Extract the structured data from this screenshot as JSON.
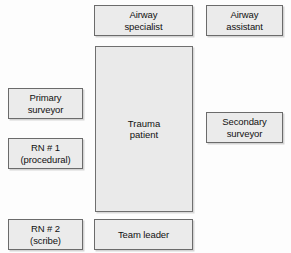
{
  "diagram": {
    "type": "room-layout-diagram",
    "canvas": {
      "width": 291,
      "height": 253,
      "background": "#fdfdfd"
    },
    "style": {
      "box_fill": "#ebebeb",
      "box_border": "#6b6b6b",
      "patient_fill": "#eaeaea",
      "patient_border": "#6f6f6f",
      "text_color": "#111111"
    },
    "patient": {
      "label": "Trauma\npatient",
      "x": 95,
      "y": 46,
      "width": 98,
      "height": 166
    },
    "roles": [
      {
        "name": "airway-specialist",
        "label": "Airway\nspecialist",
        "x": 94,
        "y": 5,
        "width": 99,
        "height": 31
      },
      {
        "name": "airway-assistant",
        "label": "Airway\nassistant",
        "x": 206,
        "y": 5,
        "width": 77,
        "height": 31
      },
      {
        "name": "primary-surveyor",
        "label": "Primary\nsurveyor",
        "x": 8,
        "y": 88,
        "width": 75,
        "height": 31
      },
      {
        "name": "secondary-surveyor",
        "label": "Secondary\nsurveyor",
        "x": 206,
        "y": 112,
        "width": 77,
        "height": 31
      },
      {
        "name": "rn-1-procedural",
        "label": "RN # 1\n(procedural)",
        "x": 8,
        "y": 138,
        "width": 75,
        "height": 31
      },
      {
        "name": "rn-2-scribe",
        "label": "RN # 2\n(scribe)",
        "x": 8,
        "y": 219,
        "width": 75,
        "height": 31
      },
      {
        "name": "team-leader",
        "label": "Team leader",
        "x": 94,
        "y": 219,
        "width": 99,
        "height": 31
      }
    ]
  }
}
